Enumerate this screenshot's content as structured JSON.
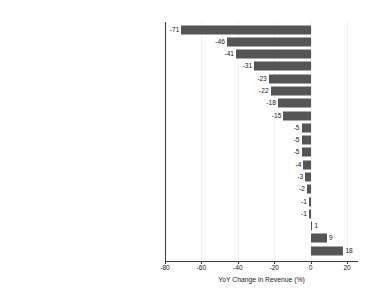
{
  "chart_data": {
    "type": "bar",
    "orientation": "horizontal",
    "title": "",
    "xlabel": "YoY Change in Revenue (%)",
    "ylabel": "",
    "xlim": [
      -80,
      26
    ],
    "xticks": [
      -80,
      -60,
      -40,
      -20,
      0,
      20
    ],
    "xtick_labels": [
      "-80",
      "-60",
      "-40",
      "-20",
      "0",
      "20"
    ],
    "grid": true,
    "legend": null,
    "bar_color": "#555555",
    "categories": [
      "Arts, Entertainment, and Recreation",
      "Mining, Quarrying, and Oil/Gas",
      "Accommodation and Food Services",
      "Agriculture, Forestry, Fishing",
      "Transportation and Warehousing",
      "Other Services",
      "Wholesale Trade",
      "Real Estate",
      "Finance and Insurnace",
      "Professional and Scientific Services",
      "Public Administration",
      "Educational Services",
      "Admin, Support, and Waste Management",
      "Retail Trade",
      "Health Care",
      "Utilities",
      "Information",
      "Construction",
      "Manufacturing"
    ],
    "values": [
      -71,
      -46,
      -41,
      -31,
      -23,
      -22,
      -18,
      -15,
      -5,
      -5,
      -5,
      -4,
      -3,
      -2,
      -1,
      -1,
      1,
      9,
      18
    ],
    "value_labels": [
      "-71",
      "-46",
      "-41",
      "-31",
      "-23",
      "-22",
      "-18",
      "-15",
      "-5",
      "-5",
      "-5",
      "-4",
      "-3",
      "-2",
      "-1",
      "-1",
      "1",
      "9",
      "18"
    ]
  }
}
